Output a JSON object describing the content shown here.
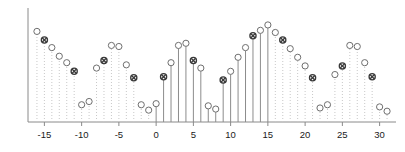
{
  "figure": {
    "title": "",
    "background_color": "#ffffff",
    "axis_color": "#8a8a8a",
    "stem_solid_color": "#8c8c8c",
    "stem_dotted_color": "#c8c8c8",
    "marker_circle_color": "#6e6e6e",
    "marker_cross_color": "#3a3a3a"
  },
  "chart_data": {
    "type": "stem",
    "title": "",
    "xlabel": "",
    "ylabel": "",
    "xlim": [
      -17.2,
      32.2
    ],
    "ylim": [
      0,
      1.02
    ],
    "grid": false,
    "xticks": [
      -15,
      -10,
      -5,
      0,
      5,
      10,
      15,
      20,
      25,
      30
    ],
    "xtick_labels": [
      "-15",
      "-10",
      "-5",
      "0",
      "5",
      "10",
      "15",
      "20",
      "25",
      "30"
    ],
    "yticks": [],
    "ytick_labels": [],
    "solid_stem_range": [
      0,
      15
    ],
    "legend": [],
    "marker_styles": [
      "circle",
      "circle-x"
    ],
    "x": [
      -16,
      -15,
      -14,
      -13,
      -12,
      -11,
      -10,
      -9,
      -8,
      -7,
      -6,
      -5,
      -4,
      -3,
      -2,
      -1,
      0,
      1,
      2,
      3,
      4,
      5,
      6,
      7,
      8,
      9,
      10,
      11,
      12,
      13,
      14,
      15,
      16,
      17,
      18,
      19,
      20,
      21,
      22,
      23,
      24,
      25,
      26,
      27,
      28,
      29,
      30,
      31
    ],
    "values": [
      0.84,
      0.76,
      0.69,
      0.61,
      0.55,
      0.47,
      0.16,
      0.19,
      0.5,
      0.57,
      0.71,
      0.7,
      0.53,
      0.41,
      0.16,
      0.11,
      0.17,
      0.42,
      0.55,
      0.71,
      0.73,
      0.57,
      0.5,
      0.15,
      0.12,
      0.39,
      0.47,
      0.6,
      0.69,
      0.8,
      0.85,
      0.9,
      0.83,
      0.76,
      0.68,
      0.6,
      0.52,
      0.41,
      0.13,
      0.16,
      0.44,
      0.52,
      0.71,
      0.7,
      0.55,
      0.42,
      0.14,
      0.1
    ],
    "markers": [
      "circle",
      "circle-x",
      "circle",
      "circle",
      "circle",
      "circle-x",
      "circle",
      "circle",
      "circle",
      "circle-x",
      "circle",
      "circle",
      "circle",
      "circle-x",
      "circle",
      "circle",
      "circle",
      "circle-x",
      "circle",
      "circle",
      "circle",
      "circle-x",
      "circle",
      "circle",
      "circle",
      "circle-x",
      "circle",
      "circle",
      "circle",
      "circle-x",
      "circle",
      "circle",
      "circle",
      "circle-x",
      "circle",
      "circle",
      "circle",
      "circle-x",
      "circle",
      "circle",
      "circle",
      "circle-x",
      "circle",
      "circle",
      "circle",
      "circle-x",
      "circle",
      "circle"
    ]
  }
}
